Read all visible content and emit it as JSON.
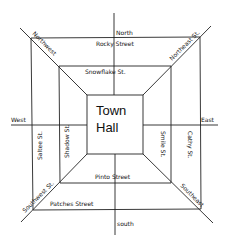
{
  "map": {
    "title": "Town Hall",
    "center": {
      "line1": "Town",
      "line2": "Hall"
    },
    "directions": {
      "north": "North",
      "south": "south",
      "east": "East",
      "west": "West",
      "northwest": "Northwest",
      "northeast": "Northeast St.",
      "southwest": "Southwest St.",
      "southeast": "Southeast"
    },
    "streets": {
      "outer_top": "Rocky Street",
      "middle_top": "Snowflake St.",
      "outer_left": "Saltee St.",
      "middle_left": "Shadow St.",
      "middle_right": "Smile St.",
      "outer_right": "Cathy St.",
      "middle_bottom": "Pinto Street",
      "outer_bottom": "Patches Street"
    },
    "colors": {
      "ink": "#222222",
      "background": "#ffffff"
    }
  }
}
